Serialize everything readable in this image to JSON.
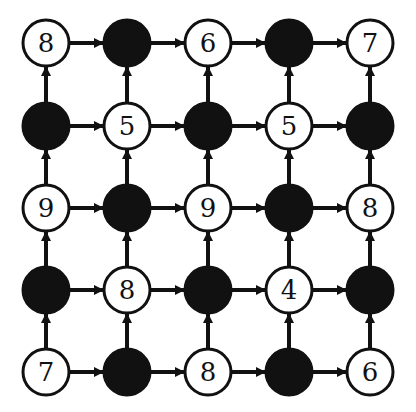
{
  "diagram": {
    "type": "grid-directed-graph",
    "rows": 5,
    "cols": 5,
    "edge_directions": {
      "horizontal": "left-to-right",
      "vertical": "bottom-to-top"
    },
    "colors": {
      "filled": "#111111",
      "stroke": "#111111",
      "empty_fill": "#ffffff"
    },
    "nodes": [
      [
        {
          "value": "8",
          "filled": false
        },
        {
          "value": "",
          "filled": true
        },
        {
          "value": "6",
          "filled": false
        },
        {
          "value": "",
          "filled": true
        },
        {
          "value": "7",
          "filled": false
        }
      ],
      [
        {
          "value": "",
          "filled": true
        },
        {
          "value": "5",
          "filled": false
        },
        {
          "value": "",
          "filled": true
        },
        {
          "value": "5",
          "filled": false
        },
        {
          "value": "",
          "filled": true
        }
      ],
      [
        {
          "value": "9",
          "filled": false
        },
        {
          "value": "",
          "filled": true
        },
        {
          "value": "9",
          "filled": false
        },
        {
          "value": "",
          "filled": true
        },
        {
          "value": "8",
          "filled": false
        }
      ],
      [
        {
          "value": "",
          "filled": true
        },
        {
          "value": "8",
          "filled": false
        },
        {
          "value": "",
          "filled": true
        },
        {
          "value": "4",
          "filled": false
        },
        {
          "value": "",
          "filled": true
        }
      ],
      [
        {
          "value": "7",
          "filled": false
        },
        {
          "value": "",
          "filled": true
        },
        {
          "value": "8",
          "filled": false
        },
        {
          "value": "",
          "filled": true
        },
        {
          "value": "6",
          "filled": false
        }
      ]
    ]
  }
}
